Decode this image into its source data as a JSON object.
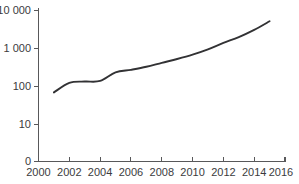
{
  "chart_data": {
    "type": "line",
    "title": "",
    "subtitle": "",
    "xlabel": "",
    "ylabel": "",
    "yscale": "log",
    "grid": false,
    "legend": false,
    "xlim": [
      2000,
      2016
    ],
    "ylim": [
      0,
      10000
    ],
    "x_ticks": [
      2000,
      2002,
      2004,
      2006,
      2008,
      2010,
      2012,
      2014,
      2016
    ],
    "x_tick_labels": [
      "2000",
      "2002",
      "2004",
      "2006",
      "2008",
      "2010",
      "2012",
      "2014",
      "2016"
    ],
    "x_minor_ticks": [
      2001,
      2003,
      2005,
      2007,
      2009,
      2011,
      2013,
      2015
    ],
    "y_ticks": [
      0,
      10,
      100,
      1000,
      10000
    ],
    "y_tick_labels": [
      "0",
      "10",
      "100",
      "1 000",
      "10 000"
    ],
    "series": [
      {
        "name": "series-1",
        "color": "#323234",
        "x": [
          2001,
          2002,
          2003,
          2004,
          2005,
          2006,
          2007,
          2008,
          2009,
          2010,
          2011,
          2012,
          2013,
          2014,
          2015
        ],
        "values": [
          70,
          125,
          135,
          140,
          235,
          275,
          330,
          420,
          530,
          690,
          950,
          1400,
          2000,
          3100,
          5200
        ]
      }
    ]
  },
  "axis": {
    "y_label_10000": "10 000",
    "y_label_1000": "1 000",
    "y_label_100": "100",
    "y_label_10": "10",
    "y_label_0": "0",
    "x_label_2000": "2000",
    "x_label_2002": "2002",
    "x_label_2004": "2004",
    "x_label_2006": "2006",
    "x_label_2008": "2008",
    "x_label_2010": "2010",
    "x_label_2012": "2012",
    "x_label_2014": "2014",
    "x_label_2016": "2016"
  },
  "colors": {
    "line": "#323234",
    "axis": "#58585a",
    "text": "#3b3b3d",
    "background": "#ffffff"
  }
}
